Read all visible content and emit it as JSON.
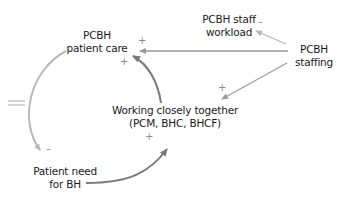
{
  "diagram": {
    "type": "causal-loop",
    "nodes": [
      {
        "id": "patient_care",
        "line1": "PCBH",
        "line2": "patient care"
      },
      {
        "id": "staff_workload",
        "line1": "PCBH staff",
        "line2": "workload"
      },
      {
        "id": "staffing",
        "line1": "PCBH",
        "line2": "staffing"
      },
      {
        "id": "working_together",
        "line1": "Working closely together",
        "line2": "(PCM, BHC, BHCF)"
      },
      {
        "id": "patient_need",
        "line1": "Patient need",
        "line2": "for BH"
      }
    ],
    "edges": [
      {
        "from": "staffing",
        "to": "staff_workload",
        "polarity": "–",
        "color": "#b8b8b8"
      },
      {
        "from": "staffing",
        "to": "patient_care",
        "polarity": "+",
        "color": "#9a9a9a"
      },
      {
        "from": "staffing",
        "to": "working_together",
        "polarity": "+",
        "color": "#9a9a9a"
      },
      {
        "from": "working_together",
        "to": "patient_care",
        "polarity": "+",
        "color": "#7a7a7a"
      },
      {
        "from": "patient_care",
        "to": "patient_need",
        "polarity": "–",
        "color": "#b8b8b8",
        "delay": true
      },
      {
        "from": "patient_need",
        "to": "working_together",
        "polarity": "+",
        "color": "#7a7a7a"
      }
    ],
    "signs": {
      "workload": "–",
      "care_from_staffing": "+",
      "care_from_working": "+",
      "working_from_staffing": "+",
      "need_from_care": "–",
      "working_from_need": "+"
    }
  }
}
